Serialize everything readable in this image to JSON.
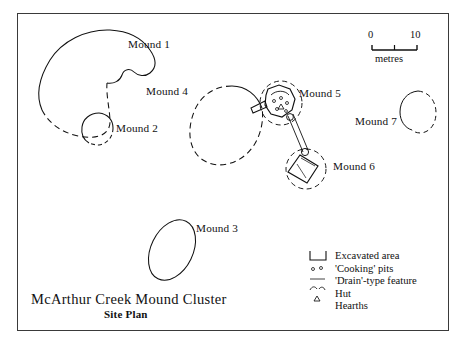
{
  "title": {
    "main": "McArthur Creek Mound Cluster",
    "sub": "Site Plan"
  },
  "scale": {
    "start": "0",
    "end": "10",
    "units": "metres"
  },
  "mounds": [
    {
      "id": "mound-1",
      "label": "Mound 1"
    },
    {
      "id": "mound-2",
      "label": "Mound 2"
    },
    {
      "id": "mound-3",
      "label": "Mound 3"
    },
    {
      "id": "mound-4",
      "label": "Mound 4"
    },
    {
      "id": "mound-5",
      "label": "Mound 5"
    },
    {
      "id": "mound-6",
      "label": "Mound 6"
    },
    {
      "id": "mound-7",
      "label": "Mound 7"
    }
  ],
  "legend": [
    {
      "symbol": "excavated-area-symbol",
      "label": "Excavated area"
    },
    {
      "symbol": "cooking-pits-symbol",
      "label": "'Cooking' pits"
    },
    {
      "symbol": "drain-feature-symbol",
      "label": "'Drain'-type feature"
    },
    {
      "symbol": "hut-symbol",
      "label": "Hut"
    },
    {
      "symbol": "hearths-symbol",
      "label": "Hearths"
    }
  ],
  "colors": {
    "ink": "#111111",
    "frame": "#3a3a3a",
    "paper": "#ffffff"
  }
}
